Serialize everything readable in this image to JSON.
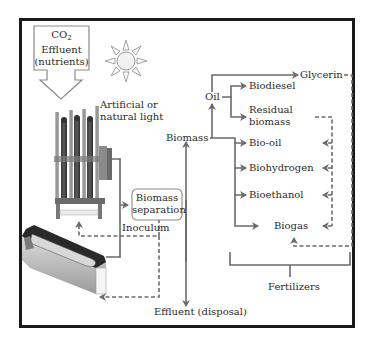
{
  "diagram": {
    "type": "process-flow",
    "colors": {
      "frame": "#1a1a1a",
      "arrow": "#6b6b6b",
      "dashed_arrow": "#6b6b6b",
      "text": "#2b2b2b",
      "sun_fill": "#f2f2f2",
      "sun_stroke": "#9a9a9a"
    },
    "inputs": {
      "co2_label": "CO",
      "co2_subscript": "2",
      "effluent_label": "Effluent",
      "nutrients_label": "(nutrients)",
      "light_label_line1": "Artificial or",
      "light_label_line2": "natural light"
    },
    "separation": {
      "line1": "Biomass",
      "line2": "separation"
    },
    "inoculum_label": "Inoculum",
    "effluent_disposal_label": "Effluent (disposal)",
    "biomass_label": "Biomass",
    "oil_label": "Oil",
    "products": {
      "glycerin": "Glycerin",
      "biodiesel": "Biodiesel",
      "residual_line1": "Residual",
      "residual_line2": "biomass",
      "bio_oil": "Bio-oil",
      "biohydrogen": "Biohydrogen",
      "bioethanol": "Bioethanol",
      "biogas": "Biogas"
    },
    "fertilizers_label": "Fertilizers",
    "nodes": [
      "CO2 Effluent (nutrients)",
      "Artificial or natural light",
      "Photobioreactor",
      "Raceway pond",
      "Biomass separation",
      "Inoculum",
      "Effluent (disposal)",
      "Biomass",
      "Oil",
      "Glycerin",
      "Biodiesel",
      "Residual biomass",
      "Bio-oil",
      "Biohydrogen",
      "Bioethanol",
      "Biogas",
      "Fertilizers"
    ],
    "edges": [
      {
        "from": "CO2 Effluent (nutrients)",
        "to": "Photobioreactor",
        "style": "solid"
      },
      {
        "from": "Photobioreactor",
        "to": "Biomass separation",
        "style": "solid"
      },
      {
        "from": "Raceway pond",
        "to": "Biomass separation",
        "style": "solid"
      },
      {
        "from": "Biomass separation",
        "to": "Biomass",
        "style": "solid"
      },
      {
        "from": "Biomass separation",
        "to": "Effluent (disposal)",
        "style": "solid"
      },
      {
        "from": "Biomass separation",
        "to": "Photobioreactor",
        "style": "dashed",
        "label": "Inoculum"
      },
      {
        "from": "Biomass separation",
        "to": "Raceway pond",
        "style": "dashed"
      },
      {
        "from": "Biomass",
        "to": "Oil",
        "style": "solid"
      },
      {
        "from": "Oil",
        "to": "Glycerin",
        "style": "solid"
      },
      {
        "from": "Oil",
        "to": "Biodiesel",
        "style": "solid"
      },
      {
        "from": "Oil",
        "to": "Residual biomass",
        "style": "solid"
      },
      {
        "from": "Biomass",
        "to": "Bio-oil",
        "style": "solid"
      },
      {
        "from": "Biomass",
        "to": "Biohydrogen",
        "style": "solid"
      },
      {
        "from": "Biomass",
        "to": "Bioethanol",
        "style": "solid"
      },
      {
        "from": "Biomass",
        "to": "Biogas",
        "style": "solid"
      },
      {
        "from": "Residual biomass",
        "to": "Bio-oil",
        "style": "dashed"
      },
      {
        "from": "Residual biomass",
        "to": "Biohydrogen",
        "style": "dashed"
      },
      {
        "from": "Residual biomass",
        "to": "Bioethanol",
        "style": "dashed"
      },
      {
        "from": "Residual biomass",
        "to": "Biogas",
        "style": "dashed"
      },
      {
        "from": "Glycerin",
        "to": "Biogas",
        "style": "dashed"
      },
      {
        "from": "Products",
        "to": "Fertilizers",
        "style": "bracket"
      }
    ]
  }
}
